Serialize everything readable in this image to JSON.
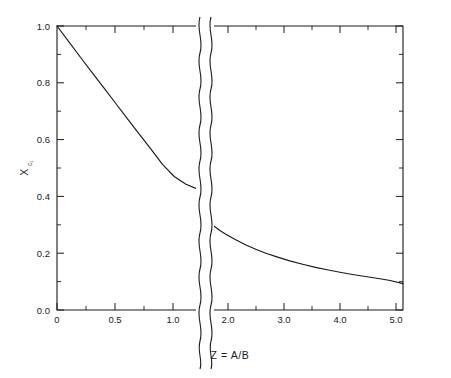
{
  "chart_data": {
    "type": "line",
    "title": "",
    "subtitle": "",
    "xlabel": "Z = A/B",
    "xlabel_parts": {
      "symbol": "Z",
      "equals": "=",
      "ratio": "A/B"
    },
    "ylabel": "X",
    "ylabel_symbol": "X",
    "ylabel_subscript": "c₁",
    "xlim": [
      0,
      5.45
    ],
    "ylim": [
      0.0,
      1.0
    ],
    "grid": false,
    "legend": null,
    "legend_position": "none",
    "x_ticks": [
      0,
      0.5,
      1.0,
      2.0,
      3.0,
      4.0,
      5.0
    ],
    "x_tick_labels": [
      "0",
      "0.5",
      "1.0",
      "2.0",
      "3.0",
      "4.0",
      "5.0"
    ],
    "x_minor_ticks": [
      0.25,
      0.75,
      2.5,
      3.5,
      4.5
    ],
    "y_ticks": [
      0.0,
      0.2,
      0.4,
      0.6,
      0.8,
      1.0
    ],
    "y_tick_labels": [
      "0.0",
      "0.2",
      "0.4",
      "0.6",
      "0.8",
      "1.0"
    ],
    "y_minor_ticks": [
      0.1,
      0.3,
      0.5,
      0.7,
      0.9
    ],
    "axis_break": {
      "axis": "x",
      "from": 1.22,
      "to": 1.72,
      "style": "double-wavy-vertical"
    },
    "series": [
      {
        "name": "X_c1 vs Z",
        "color": "#1a1a1a",
        "x": [
          0.0,
          0.1,
          0.2,
          0.3,
          0.4,
          0.5,
          0.6,
          0.7,
          0.8,
          0.9,
          1.0,
          1.1,
          1.22,
          1.72,
          1.8,
          1.9,
          2.0,
          2.2,
          2.4,
          2.6,
          2.8,
          3.0,
          3.25,
          3.5,
          3.75,
          4.0,
          4.25,
          4.5,
          4.75,
          5.0,
          5.2,
          5.45
        ],
        "y": [
          1.0,
          0.945,
          0.89,
          0.836,
          0.782,
          0.728,
          0.674,
          0.62,
          0.567,
          0.513,
          0.47,
          0.443,
          0.422,
          0.302,
          0.292,
          0.279,
          0.268,
          0.247,
          0.229,
          0.213,
          0.199,
          0.187,
          0.173,
          0.161,
          0.15,
          0.141,
          0.132,
          0.124,
          0.117,
          0.11,
          0.104,
          0.093
        ]
      }
    ],
    "annotations": []
  },
  "colors": {
    "ink": "#1a1a1a",
    "background": "#ffffff"
  }
}
